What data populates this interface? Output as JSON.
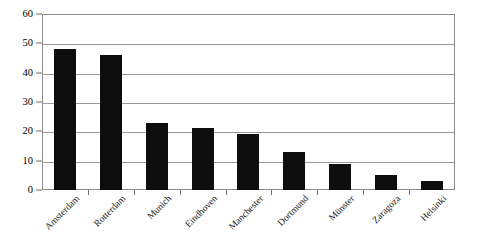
{
  "chart_data": {
    "type": "bar",
    "title": "",
    "subtitle": "",
    "xlabel": "",
    "ylabel": "",
    "categories": [
      "Amsterdam",
      "Rotterdam",
      "Munich",
      "Eindhoven",
      "Manchester",
      "Dortmund",
      "Münster",
      "Zaragoza",
      "Helsinki"
    ],
    "values": [
      48,
      46,
      23,
      21,
      19,
      13,
      9,
      5,
      3
    ],
    "ylim": [
      0,
      60
    ],
    "y_ticks": [
      0,
      10,
      20,
      30,
      40,
      50,
      60
    ],
    "y_tick_labels": [
      "0",
      "10",
      "20",
      "30",
      "40",
      "50",
      "60"
    ],
    "grid": true,
    "grid_axis": "y",
    "legend": false,
    "legend_position": "none",
    "bar_color": "#0d0d0d",
    "grid_color": "#9a9a9a",
    "frame_color": "#8c8c8c",
    "background_color": "#ffffff",
    "x_tick_label_rotation": -45
  }
}
